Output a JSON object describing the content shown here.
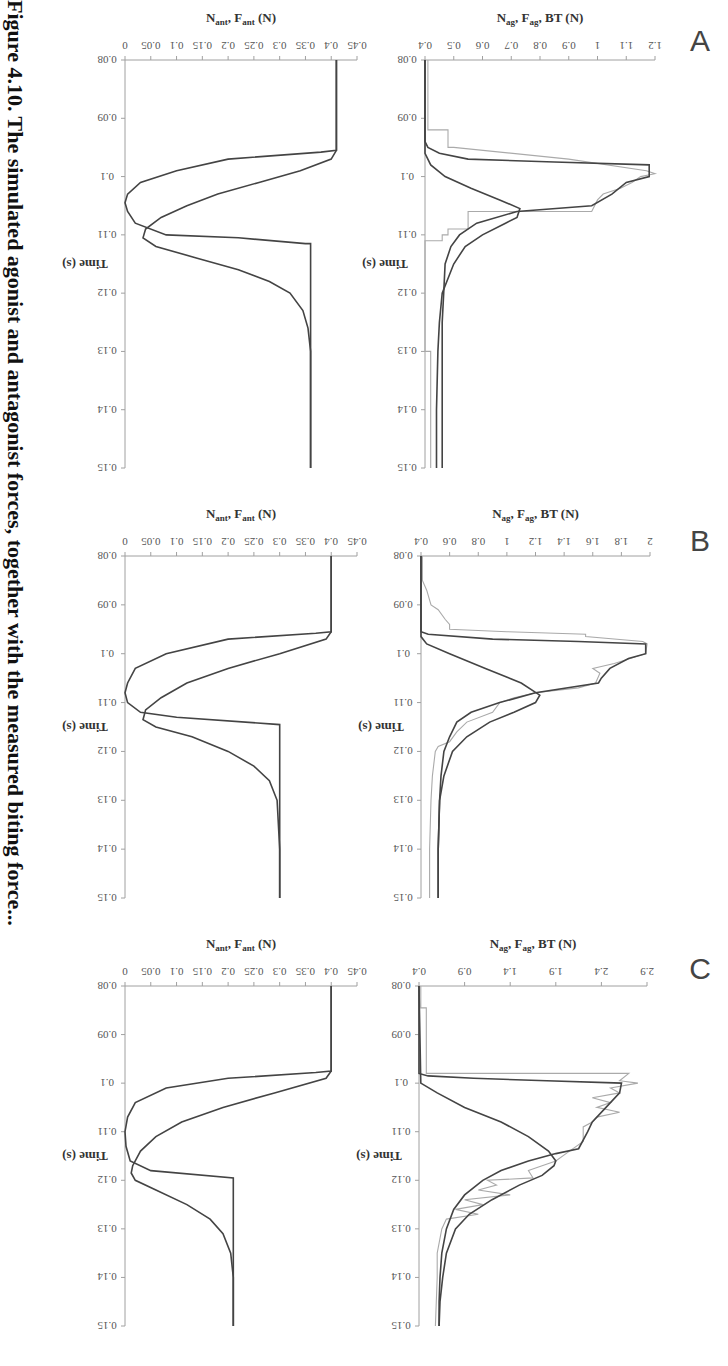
{
  "figure": {
    "caption_fragment": "Figure 4.10. The simulated agonist and antagonist forces, together with the measured biting force...",
    "panels": [
      "A",
      "B",
      "C"
    ],
    "time_axis_label": "Time (s)",
    "agonist_axis_label": {
      "main": "N",
      "sub1": "ag",
      "mid1": ", F",
      "sub2": "ag",
      "end": ", BT (N)"
    },
    "antagonist_axis_label": {
      "main": "N",
      "sub1": "ant",
      "mid1": ", F",
      "sub2": "ant",
      "end": " (N)"
    }
  },
  "chart_data": [
    {
      "panel": "A",
      "subplot": "agonist",
      "type": "line",
      "xlabel": "Time (s)",
      "ylabel": "N_ag, F_ag, BT (N)",
      "xlim": [
        0.08,
        0.15
      ],
      "ylim": [
        0.4,
        1.2
      ],
      "xticks": [
        0.08,
        0.09,
        0.1,
        0.11,
        0.12,
        0.13,
        0.14,
        0.15
      ],
      "yticks": [
        0.4,
        0.5,
        0.6,
        0.7,
        0.8,
        0.9,
        1,
        1.1,
        1.2
      ],
      "series": [
        {
          "name": "F_ag (model force)",
          "style": "dark",
          "x": [
            0.08,
            0.094,
            0.095,
            0.096,
            0.097,
            0.0975,
            0.098,
            0.099,
            0.1,
            0.101,
            0.103,
            0.105,
            0.106,
            0.108,
            0.11,
            0.112,
            0.115,
            0.12,
            0.125,
            0.13,
            0.14,
            0.15
          ],
          "y": [
            0.4,
            0.4,
            0.41,
            0.45,
            0.55,
            0.85,
            1.18,
            1.18,
            1.18,
            1.1,
            1.05,
            0.98,
            0.72,
            0.58,
            0.52,
            0.49,
            0.47,
            0.465,
            0.46,
            0.46,
            0.46,
            0.46
          ]
        },
        {
          "name": "N_ag (neural drive)",
          "style": "dark",
          "x": [
            0.08,
            0.096,
            0.098,
            0.1,
            0.102,
            0.104,
            0.1055,
            0.107,
            0.108,
            0.11,
            0.112,
            0.115,
            0.12,
            0.125,
            0.13,
            0.14,
            0.15
          ],
          "y": [
            0.4,
            0.4,
            0.42,
            0.47,
            0.56,
            0.66,
            0.73,
            0.72,
            0.68,
            0.6,
            0.54,
            0.5,
            0.46,
            0.45,
            0.445,
            0.44,
            0.44
          ]
        },
        {
          "name": "BT (measured biting force)",
          "style": "light",
          "x": [
            0.08,
            0.092,
            0.092,
            0.095,
            0.095,
            0.097,
            0.099,
            0.0995,
            0.1,
            0.101,
            0.102,
            0.103,
            0.104,
            0.106,
            0.106,
            0.109,
            0.109,
            0.11,
            0.11,
            0.111,
            0.111,
            0.13,
            0.13,
            0.15
          ],
          "y": [
            0.41,
            0.41,
            0.48,
            0.48,
            0.5,
            0.9,
            1.17,
            1.2,
            1.15,
            1.12,
            1.08,
            1.02,
            1.0,
            0.98,
            0.55,
            0.55,
            0.48,
            0.48,
            0.46,
            0.46,
            0.4,
            0.4,
            0.42,
            0.42
          ]
        }
      ]
    },
    {
      "panel": "A",
      "subplot": "antagonist",
      "type": "line",
      "xlabel": "Time (s)",
      "ylabel": "N_ant, F_ant (N)",
      "xlim": [
        0.08,
        0.15
      ],
      "ylim": [
        0,
        0.45
      ],
      "xticks": [
        0.08,
        0.09,
        0.1,
        0.11,
        0.12,
        0.13,
        0.14,
        0.15
      ],
      "yticks": [
        0,
        0.05,
        0.1,
        0.15,
        0.2,
        0.25,
        0.3,
        0.35,
        0.4,
        0.45
      ],
      "series": [
        {
          "name": "N_ant",
          "style": "dark",
          "x": [
            0.08,
            0.0955,
            0.0958,
            0.097,
            0.099,
            0.101,
            0.103,
            0.1045,
            0.106,
            0.108,
            0.11,
            0.1105,
            0.1115,
            0.1115,
            0.15
          ],
          "y": [
            0.41,
            0.41,
            0.38,
            0.2,
            0.1,
            0.03,
            0.005,
            0.0,
            0.005,
            0.02,
            0.08,
            0.22,
            0.35,
            0.36,
            0.36
          ]
        },
        {
          "name": "F_ant",
          "style": "dark",
          "x": [
            0.08,
            0.0955,
            0.097,
            0.099,
            0.101,
            0.103,
            0.105,
            0.107,
            0.109,
            0.1105,
            0.112,
            0.114,
            0.116,
            0.118,
            0.12,
            0.123,
            0.126,
            0.13,
            0.15
          ],
          "y": [
            0.41,
            0.41,
            0.4,
            0.34,
            0.26,
            0.18,
            0.12,
            0.07,
            0.04,
            0.035,
            0.06,
            0.14,
            0.22,
            0.28,
            0.32,
            0.345,
            0.355,
            0.36,
            0.36
          ]
        }
      ]
    },
    {
      "panel": "B",
      "subplot": "agonist",
      "type": "line",
      "xlabel": "Time (s)",
      "ylabel": "N_ag, F_ag, BT (N)",
      "xlim": [
        0.08,
        0.15
      ],
      "ylim": [
        0.4,
        2.0
      ],
      "xticks": [
        0.08,
        0.09,
        0.1,
        0.11,
        0.12,
        0.13,
        0.14,
        0.15
      ],
      "yticks": [
        0.4,
        0.6,
        0.8,
        1,
        1.2,
        1.4,
        1.6,
        1.8,
        2
      ],
      "series": [
        {
          "name": "F_ag (model force)",
          "style": "dark",
          "x": [
            0.08,
            0.0955,
            0.096,
            0.097,
            0.0975,
            0.098,
            0.1,
            0.101,
            0.103,
            0.105,
            0.106,
            0.108,
            0.11,
            0.112,
            0.114,
            0.117,
            0.12,
            0.125,
            0.13,
            0.14,
            0.15
          ],
          "y": [
            0.4,
            0.4,
            0.45,
            0.9,
            1.5,
            1.97,
            1.97,
            1.85,
            1.72,
            1.66,
            1.64,
            1.2,
            0.95,
            0.75,
            0.65,
            0.6,
            0.56,
            0.54,
            0.53,
            0.52,
            0.52
          ]
        },
        {
          "name": "N_ag (neural drive)",
          "style": "dark",
          "x": [
            0.08,
            0.0965,
            0.098,
            0.1,
            0.103,
            0.106,
            0.1085,
            0.11,
            0.112,
            0.114,
            0.117,
            0.12,
            0.125,
            0.13,
            0.14,
            0.15
          ],
          "y": [
            0.4,
            0.4,
            0.44,
            0.6,
            0.85,
            1.1,
            1.23,
            1.2,
            1.05,
            0.88,
            0.72,
            0.62,
            0.56,
            0.53,
            0.52,
            0.52
          ]
        },
        {
          "name": "BT (measured biting force)",
          "style": "light",
          "x": [
            0.08,
            0.085,
            0.087,
            0.09,
            0.091,
            0.093,
            0.094,
            0.095,
            0.0955,
            0.096,
            0.0965,
            0.0975,
            0.098,
            0.1,
            0.102,
            0.103,
            0.104,
            0.106,
            0.107,
            0.108,
            0.109,
            0.11,
            0.112,
            0.114,
            0.116,
            0.118,
            0.119,
            0.12,
            0.125,
            0.13,
            0.14,
            0.15
          ],
          "y": [
            0.41,
            0.41,
            0.44,
            0.47,
            0.52,
            0.57,
            0.6,
            0.6,
            1.0,
            1.55,
            1.55,
            1.95,
            1.98,
            1.97,
            1.75,
            1.6,
            1.65,
            1.62,
            1.5,
            1.2,
            1.05,
            0.95,
            0.9,
            0.72,
            0.65,
            0.6,
            0.52,
            0.5,
            0.48,
            0.47,
            0.46,
            0.46
          ]
        }
      ]
    },
    {
      "panel": "B",
      "subplot": "antagonist",
      "type": "line",
      "xlabel": "Time (s)",
      "ylabel": "N_ant, F_ant (N)",
      "xlim": [
        0.08,
        0.15
      ],
      "ylim": [
        0,
        0.45
      ],
      "xticks": [
        0.08,
        0.09,
        0.1,
        0.11,
        0.12,
        0.13,
        0.14,
        0.15
      ],
      "yticks": [
        0,
        0.05,
        0.1,
        0.15,
        0.2,
        0.25,
        0.3,
        0.35,
        0.4,
        0.45
      ],
      "series": [
        {
          "name": "N_ant",
          "style": "dark",
          "x": [
            0.08,
            0.0955,
            0.0958,
            0.097,
            0.1,
            0.103,
            0.106,
            0.108,
            0.11,
            0.112,
            0.113,
            0.1145,
            0.1145,
            0.15
          ],
          "y": [
            0.4,
            0.4,
            0.37,
            0.2,
            0.08,
            0.02,
            0.005,
            0.0,
            0.005,
            0.03,
            0.1,
            0.3,
            0.3,
            0.3
          ]
        },
        {
          "name": "F_ant",
          "style": "dark",
          "x": [
            0.08,
            0.0955,
            0.097,
            0.1,
            0.103,
            0.106,
            0.109,
            0.1115,
            0.1135,
            0.115,
            0.117,
            0.12,
            0.123,
            0.126,
            0.13,
            0.14,
            0.15
          ],
          "y": [
            0.4,
            0.4,
            0.39,
            0.3,
            0.2,
            0.12,
            0.07,
            0.04,
            0.035,
            0.06,
            0.13,
            0.2,
            0.25,
            0.28,
            0.295,
            0.3,
            0.3
          ]
        }
      ]
    },
    {
      "panel": "C",
      "subplot": "agonist",
      "type": "line",
      "xlabel": "Time (s)",
      "ylabel": "N_ag, F_ag, BT (N)",
      "xlim": [
        0.08,
        0.15
      ],
      "ylim": [
        0.4,
        2.9
      ],
      "xticks": [
        0.08,
        0.09,
        0.1,
        0.11,
        0.12,
        0.13,
        0.14,
        0.15
      ],
      "yticks": [
        0.4,
        0.9,
        1.4,
        1.9,
        2.4,
        2.9
      ],
      "series": [
        {
          "name": "F_ag (model force)",
          "style": "dark",
          "x": [
            0.08,
            0.098,
            0.0985,
            0.099,
            0.0995,
            0.1,
            0.102,
            0.105,
            0.108,
            0.11,
            0.1135,
            0.1145,
            0.116,
            0.118,
            0.12,
            0.123,
            0.126,
            0.13,
            0.135,
            0.14,
            0.145,
            0.15
          ],
          "y": [
            0.4,
            0.4,
            0.5,
            1.0,
            1.8,
            2.62,
            2.6,
            2.45,
            2.3,
            2.25,
            2.15,
            1.9,
            1.6,
            1.3,
            1.1,
            0.9,
            0.78,
            0.7,
            0.65,
            0.63,
            0.62,
            0.62
          ]
        },
        {
          "name": "N_ag (neural drive)",
          "style": "dark",
          "x": [
            0.08,
            0.1,
            0.102,
            0.105,
            0.108,
            0.111,
            0.114,
            0.116,
            0.117,
            0.119,
            0.121,
            0.124,
            0.127,
            0.13,
            0.135,
            0.14,
            0.145,
            0.15
          ],
          "y": [
            0.4,
            0.42,
            0.6,
            0.9,
            1.3,
            1.6,
            1.82,
            1.9,
            1.88,
            1.75,
            1.5,
            1.2,
            0.95,
            0.8,
            0.7,
            0.66,
            0.63,
            0.62
          ]
        },
        {
          "name": "BT (measured biting force)",
          "style": "light",
          "x": [
            0.08,
            0.0845,
            0.0845,
            0.098,
            0.098,
            0.0995,
            0.1,
            0.101,
            0.102,
            0.103,
            0.104,
            0.105,
            0.106,
            0.107,
            0.108,
            0.109,
            0.11,
            0.112,
            0.114,
            0.116,
            0.117,
            0.118,
            0.1195,
            0.12,
            0.121,
            0.122,
            0.123,
            0.124,
            0.125,
            0.126,
            0.127,
            0.128,
            0.13,
            0.135,
            0.14,
            0.15
          ],
          "y": [
            0.42,
            0.42,
            0.48,
            0.48,
            2.7,
            2.6,
            2.8,
            2.5,
            2.6,
            2.3,
            2.5,
            2.35,
            2.6,
            2.35,
            2.3,
            2.2,
            2.2,
            2.2,
            2.05,
            1.9,
            1.75,
            1.6,
            1.65,
            1.15,
            1.25,
            1.05,
            1.4,
            0.9,
            1.1,
            0.8,
            1.05,
            0.7,
            0.65,
            0.6,
            0.6,
            0.58
          ]
        }
      ]
    },
    {
      "panel": "C",
      "subplot": "antagonist",
      "type": "line",
      "xlabel": "Time (s)",
      "ylabel": "N_ant, F_ant (N)",
      "xlim": [
        0.08,
        0.15
      ],
      "ylim": [
        0,
        0.45
      ],
      "xticks": [
        0.08,
        0.09,
        0.1,
        0.11,
        0.12,
        0.13,
        0.14,
        0.15
      ],
      "yticks": [
        0,
        0.05,
        0.1,
        0.15,
        0.2,
        0.25,
        0.3,
        0.35,
        0.4,
        0.45
      ],
      "series": [
        {
          "name": "N_ant",
          "style": "dark",
          "x": [
            0.08,
            0.0975,
            0.0978,
            0.099,
            0.101,
            0.104,
            0.107,
            0.11,
            0.113,
            0.116,
            0.118,
            0.1195,
            0.1195,
            0.15
          ],
          "y": [
            0.4,
            0.4,
            0.37,
            0.2,
            0.08,
            0.02,
            0.005,
            0.0,
            0.002,
            0.01,
            0.05,
            0.21,
            0.21,
            0.21
          ]
        },
        {
          "name": "F_ant",
          "style": "dark",
          "x": [
            0.08,
            0.0975,
            0.099,
            0.102,
            0.105,
            0.108,
            0.111,
            0.114,
            0.117,
            0.1185,
            0.12,
            0.122,
            0.125,
            0.128,
            0.131,
            0.135,
            0.14,
            0.15
          ],
          "y": [
            0.4,
            0.4,
            0.39,
            0.29,
            0.19,
            0.11,
            0.06,
            0.03,
            0.015,
            0.012,
            0.02,
            0.06,
            0.12,
            0.165,
            0.19,
            0.205,
            0.21,
            0.21
          ]
        }
      ]
    }
  ]
}
